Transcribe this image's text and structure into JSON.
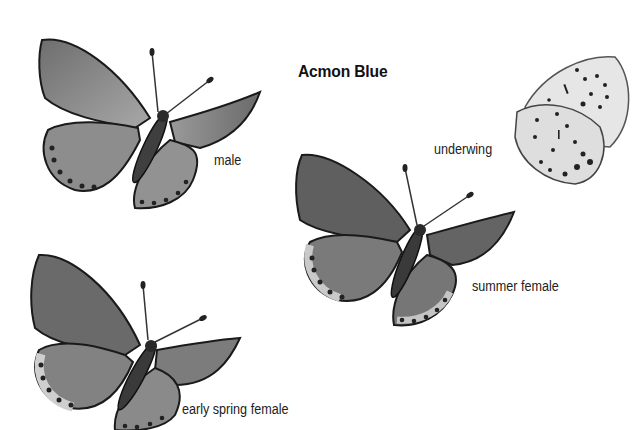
{
  "plate": {
    "title": "Acmon Blue",
    "background": "#ffffff",
    "figures": [
      {
        "id": "male",
        "label": "male"
      },
      {
        "id": "underwing",
        "label": "underwing"
      },
      {
        "id": "summer-female",
        "label": "summer female"
      },
      {
        "id": "early-spring-female",
        "label": "early spring female"
      }
    ]
  },
  "colors": {
    "wing_dark": "#5a5a5a",
    "wing_mid": "#8a8a8a",
    "wing_light": "#b5b5b5",
    "underwing": "#e4e4e4",
    "outline": "#1a1a1a",
    "spot": "#222222"
  }
}
